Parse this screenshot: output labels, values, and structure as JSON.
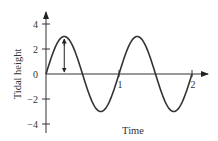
{
  "chart_data": {
    "type": "line",
    "title": "",
    "xlabel": "Time",
    "ylabel": "Tidal height",
    "xlim": [
      0,
      2.15
    ],
    "ylim": [
      -4.5,
      4.8
    ],
    "x_ticks": [
      1,
      2
    ],
    "x_tick_labels": [
      "1",
      "2"
    ],
    "y_ticks": [
      4,
      2,
      0,
      -2,
      -4
    ],
    "y_tick_labels": [
      "4",
      "2",
      "0",
      "−2",
      "−4"
    ],
    "grid": false,
    "legend": null,
    "series": [
      {
        "name": "tide",
        "function": "3*sin(2*pi*t)",
        "amplitude": 3,
        "period": 1,
        "x": [
          0,
          0.25,
          0.5,
          0.75,
          1.0,
          1.25,
          1.5,
          1.75,
          2.0
        ],
        "values": [
          0,
          3,
          0,
          -3,
          0,
          3,
          0,
          -3,
          0
        ]
      }
    ],
    "annotations": [
      {
        "type": "double-arrow",
        "x": 0.25,
        "y_from": 0,
        "y_to": 3,
        "meaning": "amplitude"
      }
    ]
  },
  "colors": {
    "curve": "#333333",
    "axis": "#333333"
  }
}
